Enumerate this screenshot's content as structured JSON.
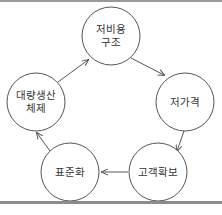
{
  "diagram": {
    "type": "cycle",
    "nodes": [
      {
        "id": "low-cost-structure",
        "lines": [
          "저비용",
          "구조"
        ],
        "cx": 111,
        "cy": 36,
        "r": 29
      },
      {
        "id": "low-price",
        "lines": [
          "저가격"
        ],
        "cx": 185,
        "cy": 102,
        "r": 29
      },
      {
        "id": "customer-acquisition",
        "lines": [
          "고객확보"
        ],
        "cx": 158,
        "cy": 172,
        "r": 29
      },
      {
        "id": "standardization",
        "lines": [
          "표준화"
        ],
        "cx": 70,
        "cy": 172,
        "r": 29
      },
      {
        "id": "mass-production-system",
        "lines": [
          "대량생산",
          "체제"
        ],
        "cx": 36,
        "cy": 102,
        "r": 29
      }
    ],
    "edges": [
      {
        "from": "mass-production-system",
        "to": "low-cost-structure"
      },
      {
        "from": "low-cost-structure",
        "to": "low-price"
      },
      {
        "from": "low-price",
        "to": "customer-acquisition"
      },
      {
        "from": "customer-acquisition",
        "to": "standardization"
      },
      {
        "from": "standardization",
        "to": "mass-production-system"
      }
    ],
    "colors": {
      "stroke": "#555555",
      "text": "#333333",
      "border": "#9a9a9a"
    }
  }
}
